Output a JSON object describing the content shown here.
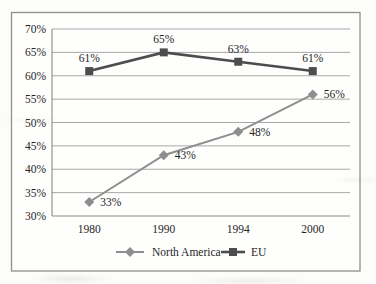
{
  "chart_data": {
    "type": "line",
    "categories": [
      "1980",
      "1990",
      "1994",
      "2000"
    ],
    "series": [
      {
        "name": "North America",
        "marker": "diamond",
        "color": "#8e8e8e",
        "line_width": 2,
        "values": [
          33,
          43,
          48,
          56
        ],
        "point_labels": [
          "33%",
          "43%",
          "48%",
          "56%"
        ],
        "label_position": "right"
      },
      {
        "name": "EU",
        "marker": "square",
        "color": "#4d4d4d",
        "line_width": 2.6,
        "values": [
          61,
          65,
          63,
          61
        ],
        "point_labels": [
          "61%",
          "65%",
          "63%",
          "61%"
        ],
        "label_position": "above"
      }
    ],
    "title": "",
    "xlabel": "",
    "ylabel": "",
    "ylim": [
      30,
      70
    ],
    "ytick_step": 5,
    "ytick_labels": [
      "30%",
      "35%",
      "40%",
      "45%",
      "50%",
      "55%",
      "60%",
      "65%",
      "70%"
    ],
    "grid": true,
    "legend_position": "bottom"
  },
  "colors": {
    "grid": "#9e9e9e",
    "axis": "#8a8a8a",
    "text": "#262626",
    "frame_border": "#909090",
    "chart_background": "#fefefd"
  }
}
